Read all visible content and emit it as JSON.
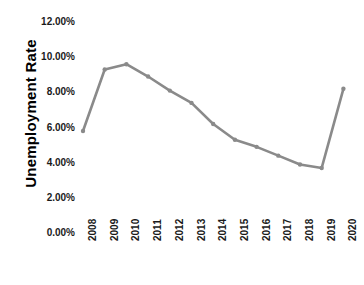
{
  "chart_data": {
    "type": "line",
    "title": "",
    "xlabel": "",
    "ylabel": "Unemployment Rate",
    "categories": [
      "2008",
      "2009",
      "2010",
      "2011",
      "2012",
      "2013",
      "2014",
      "2015",
      "2016",
      "2017",
      "2018",
      "2019",
      "2020"
    ],
    "values": [
      5.8,
      9.3,
      9.6,
      8.9,
      8.1,
      7.4,
      6.2,
      5.3,
      4.9,
      4.4,
      3.9,
      3.7,
      8.2
    ],
    "series": [
      {
        "name": "Unemployment Rate",
        "values": [
          5.8,
          9.3,
          9.6,
          8.9,
          8.1,
          7.4,
          6.2,
          5.3,
          4.9,
          4.4,
          3.9,
          3.7,
          8.2
        ]
      }
    ],
    "ylim": [
      0,
      12
    ],
    "y_tick_labels": [
      "12.00%",
      "10.00%",
      "8.00%",
      "6.00%",
      "4.00%",
      "2.00%",
      "0.00%"
    ],
    "y_tick_values": [
      12,
      10,
      8,
      6,
      4,
      2,
      0
    ],
    "x_tick_labels": [
      "2008",
      "2009",
      "2010",
      "2011",
      "2012",
      "2013",
      "2014",
      "2015",
      "2016",
      "2017",
      "2018",
      "2019",
      "2020"
    ],
    "grid": false,
    "legend": "none",
    "markers": true,
    "line_color": "#8a8a8a",
    "marker_color": "#8a8a8a",
    "background_color": "#ffffff",
    "text_color": "#1a1a1a"
  }
}
